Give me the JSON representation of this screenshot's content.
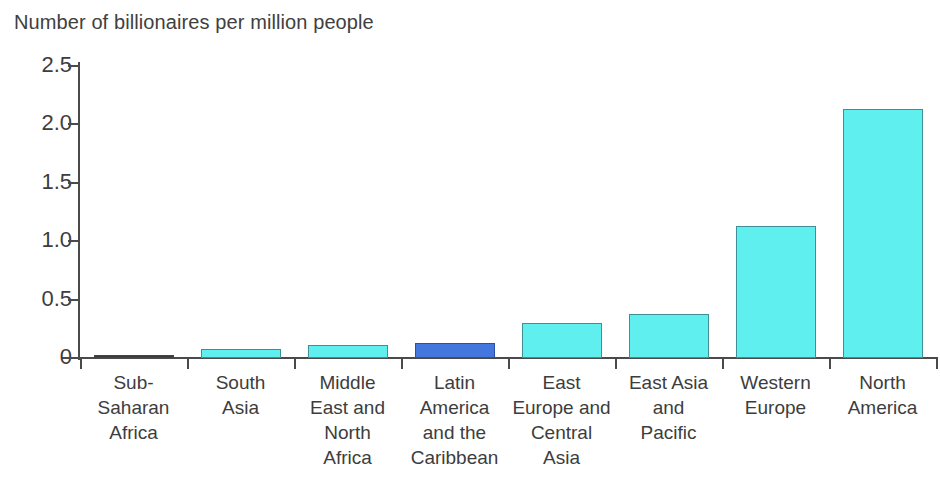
{
  "chart_data": {
    "type": "bar",
    "title": "Number of billionaires per million people",
    "subtitle": "",
    "xlabel": "",
    "ylabel": "",
    "ylim": [
      0,
      2.5
    ],
    "grid": false,
    "legend": null,
    "y_ticks": [
      "0",
      "0.5",
      "1.0",
      "1.5",
      "2.0",
      "2.5"
    ],
    "y_tick_values": [
      0,
      0.5,
      1.0,
      1.5,
      2.0,
      2.5
    ],
    "categories": [
      "Sub-Saharan Africa",
      "South Asia",
      "Middle East and North Africa",
      "Latin America and the Caribbean",
      "East Europe and Central Asia",
      "East Asia and Pacific",
      "Western Europe",
      "North America"
    ],
    "category_lines": [
      [
        "Sub-",
        "Saharan",
        "Africa"
      ],
      [
        "South",
        "Asia"
      ],
      [
        "Middle",
        "East and",
        "North",
        "Africa"
      ],
      [
        "Latin",
        "America",
        "and the",
        "Caribbean"
      ],
      [
        "East",
        "Europe and",
        "Central",
        "Asia"
      ],
      [
        "East Asia",
        "and",
        "Pacific"
      ],
      [
        "Western",
        "Europe"
      ],
      [
        "North",
        "America"
      ]
    ],
    "values": [
      0.01,
      0.08,
      0.11,
      0.13,
      0.3,
      0.38,
      1.13,
      2.13
    ],
    "bar_colors": [
      "#3a3a3a",
      "#5fefef",
      "#5fefef",
      "#4477dd",
      "#5fefef",
      "#5fefef",
      "#5fefef",
      "#5fefef"
    ],
    "highlight_index": 3,
    "colors": {
      "bar_fill": "#5fefef",
      "bar_border": "#3f8f96",
      "highlight_fill": "#4477dd",
      "highlight_border": "#2a4fa8",
      "axis": "#4a4a4a",
      "text": "#3d3d3d",
      "background": "#ffffff"
    }
  }
}
